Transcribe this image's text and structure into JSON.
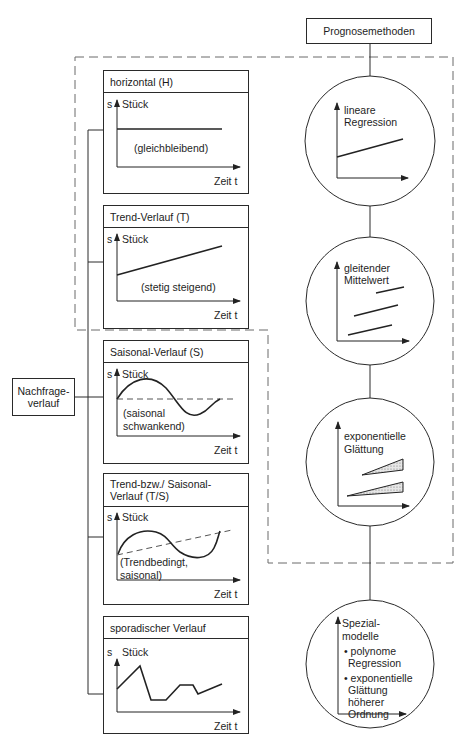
{
  "root": {
    "label": "Prognosemethoden"
  },
  "source": {
    "label_line1": "Nachfrage-",
    "label_line2": "verlauf"
  },
  "axis": {
    "y_label": "s",
    "y_unit": "Stück",
    "x_label": "Zeit t"
  },
  "patterns": [
    {
      "title": "horizontal (H)",
      "note": "(gleichbleibend)"
    },
    {
      "title": "Trend-Verlauf (T)",
      "note": "(stetig steigend)"
    },
    {
      "title": "Saisonal-Verlauf (S)",
      "note_line1": "(saisonal",
      "note_line2": "schwankend)"
    },
    {
      "title_line1": "Trend-bzw./ Saisonal-",
      "title_line2": "Verlauf (T/S)",
      "note_line1": "(Trendbedingt,",
      "note_line2": "saisonal)"
    },
    {
      "title": "sporadischer Verlauf"
    }
  ],
  "methods": [
    {
      "line1": "lineare",
      "line2": "Regression"
    },
    {
      "line1": "gleitender",
      "line2": "Mittelwert"
    },
    {
      "line1": "exponentielle",
      "line2": "Glättung"
    },
    {
      "line1": "Spezial-",
      "line2": "modelle",
      "bullets": [
        {
          "line1": "• polynome",
          "line2": "Regression"
        },
        {
          "line1": "• exponentielle",
          "line2": "Glättung",
          "line3": "höherer",
          "line4": "Ordnung"
        }
      ]
    }
  ],
  "colors": {
    "line": "#2a2a2a",
    "dashed": "#6a6a6a",
    "hatch": "#bdbdbd"
  }
}
